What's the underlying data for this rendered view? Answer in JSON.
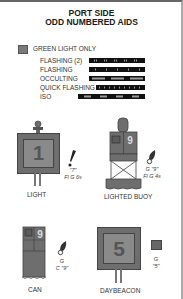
{
  "title": {
    "line1": "PORT SIDE",
    "line2": "ODD NUMBERED AIDS"
  },
  "legend": {
    "swatch_color": "#7a7a7a",
    "label": "GREEN LIGHT ONLY"
  },
  "light_characteristics": [
    {
      "label": "FLASHING (2)",
      "pattern": "flashing-2"
    },
    {
      "label": "FLASHING",
      "pattern": "flashing"
    },
    {
      "label": "OCCULTING",
      "pattern": "occulting"
    },
    {
      "label": "QUICK FLASHING",
      "pattern": "quick-flashing"
    },
    {
      "label": "ISO",
      "pattern": "iso"
    }
  ],
  "aids": {
    "light": {
      "number": "1",
      "caption": "LIGHT",
      "chart_label_line1": "\"7\"",
      "chart_label_line2": "Fl G 6s",
      "chart_symbol": "light-flare-icon"
    },
    "lighted_buoy": {
      "number": "9",
      "caption": "LIGHTED BUOY",
      "chart_label_line1": "G \"9\"",
      "chart_label_line2": "Fl G 4s",
      "chart_symbol": "lighted-buoy-symbol-icon"
    },
    "can": {
      "number": "9",
      "caption": "CAN",
      "chart_label_line1": "G",
      "chart_label_line2": "C \"9\"",
      "chart_symbol": "can-buoy-symbol-icon"
    },
    "daybeacon": {
      "number": "5",
      "caption": "DAYBEACON",
      "chart_label_line1": "G",
      "chart_label_line2": "\"5\"",
      "chart_symbol": "square-daybeacon-symbol-icon"
    }
  },
  "colors": {
    "green_dark": "#6e6e6e",
    "green_light": "#8a8a8a",
    "outline": "#444444",
    "bar": "#111111"
  }
}
